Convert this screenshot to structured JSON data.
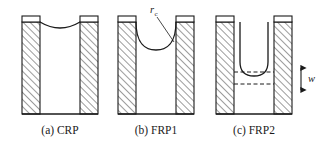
{
  "figure": {
    "type": "technical-diagram",
    "background_color": "#ffffff",
    "line_color": "#1a1a1a",
    "hatch_color": "#555555",
    "panels": [
      {
        "id": "crp",
        "caption": "(a) CRP",
        "caption_x": 60,
        "caption_y": 134,
        "wall": {
          "outer_left": 22,
          "outer_right": 98,
          "inner_left": 40,
          "inner_right": 80,
          "top": 22,
          "bottom": 114,
          "cap_top": 16,
          "cap_height": 6
        },
        "meniscus": {
          "shape": "shallow-concave",
          "left_x": 40,
          "right_x": 80,
          "top_y": 22,
          "depth": 6
        }
      },
      {
        "id": "frp1",
        "caption": "(b) FRP1",
        "caption_x": 158,
        "caption_y": 134,
        "wall": {
          "outer_left": 118,
          "outer_right": 194,
          "inner_left": 136,
          "inner_right": 176,
          "top": 22,
          "bottom": 114,
          "cap_top": 16,
          "cap_height": 6
        },
        "meniscus": {
          "shape": "deep-semicircular",
          "left_x": 136,
          "right_x": 176,
          "top_y": 22,
          "depth": 26
        },
        "annotation": {
          "label": "r",
          "subscript": "c",
          "label_x": 156,
          "label_y": 14,
          "leader_from_x": 158,
          "leader_from_y": 18,
          "leader_to_x": 172,
          "leader_to_y": 42
        }
      },
      {
        "id": "frp2",
        "caption": "(c) FRP2",
        "caption_x": 256,
        "caption_y": 134,
        "wall": {
          "outer_left": 216,
          "outer_right": 292,
          "inner_left": 234,
          "inner_right": 274,
          "top": 22,
          "bottom": 114,
          "cap_top": 16,
          "cap_height": 6
        },
        "meniscus": {
          "shape": "deep-u-channel",
          "left_x": 240,
          "right_x": 268,
          "top_y": 22,
          "bottom_y": 74,
          "corner_radius": 14
        },
        "dashed_lines": [
          {
            "y": 72,
            "x1": 234,
            "x2": 274
          },
          {
            "y": 84,
            "x1": 234,
            "x2": 274
          }
        ],
        "annotation": {
          "label": "w",
          "label_x": 312,
          "label_y": 81,
          "arrow_x": 301,
          "arrow_top_y": 66,
          "arrow_bottom_y": 92
        }
      }
    ]
  }
}
